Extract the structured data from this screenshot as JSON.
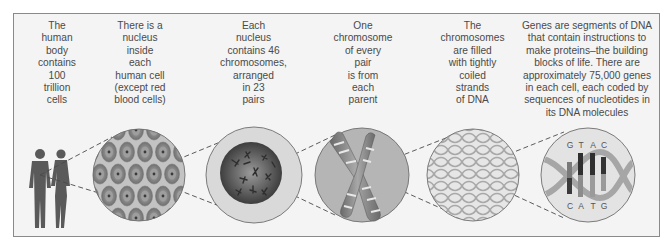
{
  "diagram": {
    "panels": [
      {
        "id": "body",
        "caption": "The\nhuman\nbody\ncontains\n100\ntrillion\ncells",
        "icon": "human-figures-icon"
      },
      {
        "id": "cell",
        "caption": "There is a\nnucleus\ninside\neach\nhuman cell\n(except red\nblood cells)",
        "icon": "cells-circle-icon"
      },
      {
        "id": "nucleus",
        "caption": "Each\nnucleus\ncontains 46\nchromosomes,\narranged\nin 23\npairs",
        "icon": "nucleus-circle-icon"
      },
      {
        "id": "chromosome",
        "caption": "One\nchromosome\nof every\npair\nis from\neach\nparent",
        "icon": "chromosome-pair-icon"
      },
      {
        "id": "strands",
        "caption": "The\nchromosomes\nare filled\nwith tightly\ncoiled\nstrands\nof DNA",
        "icon": "coiled-dna-icon"
      },
      {
        "id": "genes",
        "caption": "Genes are segments of DNA\nthat contain instructions to\nmake proteins–the building\nblocks of life. There are\napproximately 75,000 genes\nin each cell, each coded by\nsequences of nucleotides in\nits DNA molecules",
        "icon": "dna-helix-icon"
      }
    ],
    "dna_bases_top": [
      "G",
      "T",
      "A",
      "C"
    ],
    "dna_bases_bottom": [
      "C",
      "A",
      "T",
      "G"
    ],
    "colors": {
      "frame_border": "#8a8a8a",
      "background": "#f4f4f4",
      "text": "#4a4a4a",
      "figure": "#5a5a5a",
      "circle_fill": "#b9b9b9",
      "circle_stroke": "#6e6e6e"
    }
  }
}
